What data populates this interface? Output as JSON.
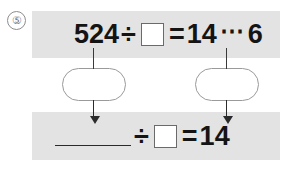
{
  "worksheet": {
    "problem_number": "⑤",
    "colors": {
      "band_background": "#e3e3e3",
      "page_background": "#ffffff",
      "text": "#141414",
      "box_border": "#6a6a6a",
      "round_box_border": "#9a9a9a",
      "arrow": "#2b2b2b",
      "problem_number_border": "#8d8d8d"
    }
  },
  "top_equation": {
    "dividend": "524",
    "divide_sign": "÷",
    "divisor_box": "",
    "equals_sign": "=",
    "quotient": "14",
    "remainder_dots": "⋯",
    "remainder": "6"
  },
  "bottom_equation": {
    "dividend_blank": "",
    "divide_sign": "÷",
    "divisor_box": "",
    "equals_sign": "=",
    "quotient": "14"
  },
  "thought_boxes": [
    {
      "label": "",
      "position": "left"
    },
    {
      "label": "",
      "position": "right"
    }
  ]
}
